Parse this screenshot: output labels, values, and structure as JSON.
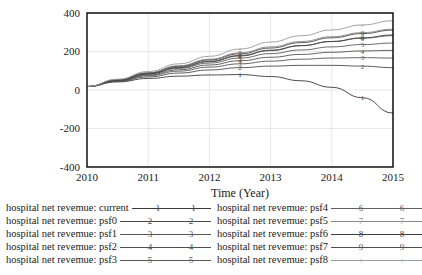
{
  "chart_data": {
    "type": "line",
    "title": "",
    "xlabel": "Time (Year)",
    "ylabel": "",
    "xlim": [
      2010,
      2015
    ],
    "ylim": [
      -400,
      400
    ],
    "xticks": [
      "2010",
      "2011",
      "2012",
      "2013",
      "2014",
      "2015"
    ],
    "yticks": [
      "400",
      "200",
      "0",
      "-200",
      "-400"
    ],
    "grid": true,
    "legend_position": "below",
    "x": [
      2010,
      2010.5,
      2011,
      2011.5,
      2012,
      2012.5,
      2013,
      2013.5,
      2014,
      2014.5,
      2015
    ],
    "series": [
      {
        "name": "hospital net revemue: current",
        "marker": "1",
        "color": "#3a3a3a",
        "values": [
          18,
          42,
          60,
          72,
          78,
          80,
          70,
          48,
          14,
          -40,
          -120
        ]
      },
      {
        "name": "hospital net revemue: psf0",
        "marker": "2",
        "color": "#4a4a4a",
        "values": [
          18,
          45,
          68,
          88,
          104,
          116,
          124,
          128,
          128,
          124,
          116
        ]
      },
      {
        "name": "hospital net revemue: psf1",
        "marker": "3",
        "color": "#555555",
        "values": [
          18,
          47,
          74,
          98,
          119,
          136,
          150,
          160,
          166,
          168,
          166
        ]
      },
      {
        "name": "hospital net revemue: psf2",
        "marker": "4",
        "color": "#505050",
        "values": [
          18,
          48,
          78,
          105,
          130,
          152,
          170,
          185,
          196,
          203,
          206
        ]
      },
      {
        "name": "hospital net revemue: psf3",
        "marker": "5",
        "color": "#5a5a5a",
        "values": [
          18,
          50,
          82,
          112,
          140,
          166,
          189,
          208,
          224,
          236,
          244
        ]
      },
      {
        "name": "hospital net revemue: psf4",
        "marker": "6",
        "color": "#606060",
        "values": [
          18,
          52,
          86,
          119,
          150,
          180,
          207,
          231,
          252,
          269,
          282
        ]
      },
      {
        "name": "hospital net revemue: psf5",
        "marker": "7",
        "color": "#8a8a8a",
        "values": [
          18,
          54,
          90,
          126,
          160,
          193,
          224,
          252,
          277,
          298,
          316
        ]
      },
      {
        "name": "hospital net revemue: psf6",
        "marker": "8",
        "color": "#3f3f3f",
        "values": [
          18,
          50,
          84,
          116,
          147,
          177,
          205,
          230,
          252,
          271,
          286
        ]
      },
      {
        "name": "hospital net revemue: psf7",
        "marker": "9",
        "color": "#4f4f4f",
        "values": [
          18,
          53,
          88,
          123,
          156,
          188,
          218,
          246,
          271,
          293,
          311
        ]
      },
      {
        "name": "hospital net revemue: psf8",
        "marker": "+",
        "color": "#9a9a9a",
        "values": [
          18,
          56,
          96,
          136,
          175,
          213,
          249,
          282,
          312,
          338,
          360
        ]
      }
    ]
  },
  "axis": {
    "xlabel": "Time (Year)",
    "xticks": [
      "2010",
      "2011",
      "2012",
      "2013",
      "2014",
      "2015"
    ],
    "yticks": [
      "400",
      "200",
      "0",
      "-200",
      "-400"
    ]
  },
  "legend": {
    "left_column": [
      {
        "label": "hospital net revemue: current",
        "marker": "1",
        "color": "#3a3a3a"
      },
      {
        "label": "hospital net revemue: psf0",
        "marker": "2",
        "color": "#4a4a4a"
      },
      {
        "label": "hospital net revemue: psf1",
        "marker": "3",
        "color": "#555555"
      },
      {
        "label": "hospital net revemue: psf2",
        "marker": "4",
        "color": "#505050"
      },
      {
        "label": "hospital net revemue: psf3",
        "marker": "5",
        "color": "#5a5a5a"
      }
    ],
    "right_column": [
      {
        "label": "hospital net revemue: psf4",
        "marker": "6",
        "color": "#606060"
      },
      {
        "label": "hospital net revemue: psf5",
        "marker": "7",
        "color": "#8a8a8a"
      },
      {
        "label": "hospital net revemue: psf6",
        "marker": "8",
        "color": "#3f3f3f"
      },
      {
        "label": "hospital net revemue: psf7",
        "marker": "9",
        "color": "#4f4f4f"
      },
      {
        "label": "hospital net revemue: psf8",
        "marker": "+",
        "color": "#9a9a9a"
      }
    ]
  }
}
